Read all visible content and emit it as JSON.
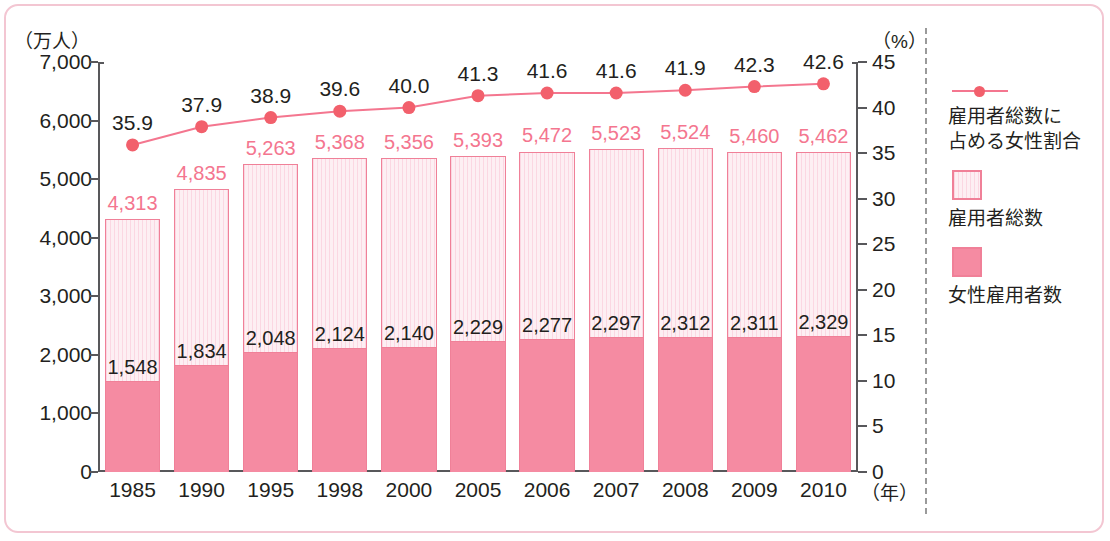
{
  "axes": {
    "left_caption": "（万人）",
    "right_caption": "（%）",
    "x_unit": "（年）",
    "left_ticks": [
      "0",
      "1,000",
      "2,000",
      "3,000",
      "4,000",
      "5,000",
      "6,000",
      "7,000"
    ],
    "right_ticks": [
      "0",
      "5",
      "10",
      "15",
      "20",
      "25",
      "30",
      "35",
      "40",
      "45"
    ]
  },
  "legend": {
    "items": [
      {
        "marker": "line-marker",
        "label": "雇用者総数に\n占める女性割合",
        "color": "#f2606c"
      },
      {
        "marker": "hatched-swatch",
        "label": "雇用者総数",
        "color": "#fbd7e2"
      },
      {
        "marker": "solid-swatch",
        "label": "女性雇用者数",
        "color": "#f58ba2"
      }
    ],
    "line_label_line1": "雇用者総数に",
    "line_label_line2": "占める女性割合",
    "total_label": "雇用者総数",
    "female_label": "女性雇用者数"
  },
  "chart_data": {
    "type": "bar",
    "title": "",
    "xlabel": "（年）",
    "ylabel": "（万人）",
    "y2label": "（%）",
    "ylim": [
      0,
      7000
    ],
    "y2lim": [
      0,
      45
    ],
    "grid": false,
    "legend_position": "right",
    "categories": [
      "1985",
      "1990",
      "1995",
      "1998",
      "2000",
      "2005",
      "2006",
      "2007",
      "2008",
      "2009",
      "2010"
    ],
    "series": [
      {
        "name": "雇用者総数",
        "type": "bar",
        "axis": "left",
        "values": [
          4313,
          4835,
          5263,
          5368,
          5356,
          5393,
          5472,
          5523,
          5524,
          5460,
          5462
        ],
        "labels": [
          "4,313",
          "4,835",
          "5,263",
          "5,368",
          "5,356",
          "5,393",
          "5,472",
          "5,523",
          "5,524",
          "5,460",
          "5,462"
        ]
      },
      {
        "name": "女性雇用者数",
        "type": "bar",
        "axis": "left",
        "values": [
          1548,
          1834,
          2048,
          2124,
          2140,
          2229,
          2277,
          2297,
          2312,
          2311,
          2329
        ],
        "labels": [
          "1,548",
          "1,834",
          "2,048",
          "2,124",
          "2,140",
          "2,229",
          "2,277",
          "2,297",
          "2,312",
          "2,311",
          "2,329"
        ]
      },
      {
        "name": "雇用者総数に占める女性割合",
        "type": "line",
        "axis": "right",
        "values": [
          35.9,
          37.9,
          38.9,
          39.6,
          40.0,
          41.3,
          41.6,
          41.6,
          41.9,
          42.3,
          42.6
        ],
        "labels": [
          "35.9",
          "37.9",
          "38.9",
          "39.6",
          "40.0",
          "41.3",
          "41.6",
          "41.6",
          "41.9",
          "42.3",
          "42.6"
        ]
      }
    ]
  },
  "colors": {
    "frame": "#f3c6d2",
    "axis": "#58585b",
    "bar_total_fill": "#fbd7e2",
    "bar_total_stroke": "#f08098",
    "bar_female_fill": "#f58ba2",
    "line": "#f4768f",
    "marker": "#f2606c",
    "total_label_text": "#f4768f",
    "female_label_text": "#231f20"
  }
}
